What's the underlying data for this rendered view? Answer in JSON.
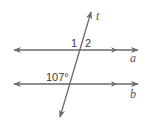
{
  "diagram": {
    "type": "parallel-lines-transversal",
    "stroke_color": "#6a6a6a",
    "lines": [
      {
        "name": "a",
        "label": "a",
        "y": 50,
        "x1": 14,
        "x2": 138,
        "parallel_marker_x": 115
      },
      {
        "name": "b",
        "label": "b",
        "y": 84,
        "x1": 14,
        "x2": 138,
        "parallel_marker_x": 115
      }
    ],
    "transversal": {
      "label": "t",
      "x1": 60,
      "y1": 117,
      "x2": 91,
      "y2": 12
    },
    "angle_labels": {
      "angle_1": "1",
      "angle_2": "2",
      "given_angle": "107°"
    }
  }
}
